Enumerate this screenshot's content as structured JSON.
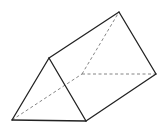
{
  "diagram": {
    "type": "triangular-prism",
    "colors": {
      "background": "#ffffff",
      "solid_edge": "#222222",
      "hidden_edge": "#777777"
    },
    "vertices": {
      "A": [
        12,
        120
      ],
      "B": [
        86,
        121
      ],
      "C": [
        49,
        58
      ],
      "D": [
        82,
        74
      ],
      "E": [
        156,
        74
      ],
      "F": [
        119,
        12
      ]
    },
    "solid_edges": [
      [
        "A",
        "B"
      ],
      [
        "B",
        "C"
      ],
      [
        "C",
        "A"
      ],
      [
        "C",
        "F"
      ],
      [
        "B",
        "E"
      ],
      [
        "F",
        "E"
      ]
    ],
    "hidden_edges": [
      [
        "A",
        "D"
      ],
      [
        "D",
        "E"
      ],
      [
        "D",
        "F"
      ]
    ]
  }
}
